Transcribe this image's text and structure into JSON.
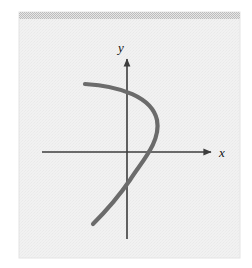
{
  "figure": {
    "name": "vertical-line-test-graph",
    "panel": {
      "background_color": "#f0f0f0",
      "border_color": "#e2e2e2",
      "top_band_color": "#c9c9c9",
      "x": 19,
      "y": 12,
      "width": 221,
      "height": 246,
      "top_band_height": 7
    },
    "axes": {
      "color": "#3d3d3d",
      "line_width": 1.6,
      "origin": {
        "x": 127,
        "y": 152
      },
      "x_axis": {
        "label": "x",
        "label_x": 219,
        "label_y": 157,
        "start_x": 42,
        "end_x": 214,
        "y": 152,
        "arrow": "right"
      },
      "y_axis": {
        "label": "y",
        "label_x": 121,
        "label_y": 52,
        "top_y": 56,
        "bottom_y": 239,
        "x": 127,
        "arrow": "up"
      }
    },
    "curve": {
      "color": "#6b6b6b",
      "line_width": 4.2,
      "start_point": {
        "x": 85,
        "y": 84
      },
      "end_point": {
        "x": 93,
        "y": 224
      },
      "rightmost_point": {
        "x": 158,
        "y": 122
      },
      "x_axis_crossing": {
        "x": 145,
        "y": 152
      },
      "path": "M 85 84 C 120 86, 152 97, 157 120 C 161 141, 143 160, 130 180 C 117 199, 103 214, 93 224"
    }
  }
}
